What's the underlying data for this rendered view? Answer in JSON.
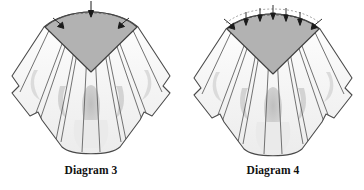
{
  "figure": {
    "background_color": "#ffffff",
    "diagrams": [
      {
        "id": "diagram-3",
        "caption": "Diagram 3",
        "subject": "gathered fan-shaped garment yoke pattern piece",
        "yoke_fill": "#b2b2b2",
        "panel_fill": "#f2f2f2",
        "shadow_fill": "#c9c9c9",
        "outline_color": "#4a4a4a",
        "marker_count": 3,
        "marker_description": "one downward arrow at center top of yoke arc and two diagonal arrows at the yoke shoulder corners",
        "panel_count": 9,
        "stitch_line": "none"
      },
      {
        "id": "diagram-4",
        "caption": "Diagram 4",
        "subject": "gathered fan-shaped garment yoke pattern piece with gathering stitches",
        "yoke_fill": "#b2b2b2",
        "panel_fill": "#f2f2f2",
        "shadow_fill": "#c9c9c9",
        "outline_color": "#4a4a4a",
        "marker_count": 7,
        "marker_description": "row of downward arrows distributed across the top yoke arc plus diagonal arrows at both shoulder corners",
        "panel_count": 9,
        "stitch_line": "dashed gathering line along top arc"
      }
    ]
  }
}
